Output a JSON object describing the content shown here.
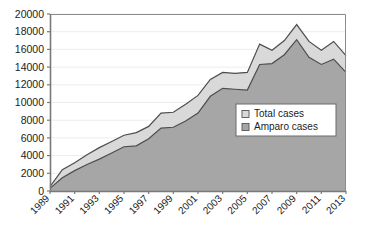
{
  "chart_data": {
    "type": "area",
    "title": "",
    "subtitle": "",
    "xlabel": "",
    "ylabel": "",
    "stacked": false,
    "grid": true,
    "grid_axis": "y",
    "legend_position": "inside-right",
    "xlim": [
      1989,
      2013
    ],
    "ylim": [
      0,
      20000
    ],
    "y_ticks": [
      0,
      2000,
      4000,
      6000,
      8000,
      10000,
      12000,
      14000,
      16000,
      18000,
      20000
    ],
    "y_tick_labels": [
      "0",
      "2000",
      "4000",
      "6000",
      "8000",
      "10000",
      "12000",
      "14000",
      "16000",
      "18000",
      "20000"
    ],
    "x_tick_labels": [
      "1989",
      "1991",
      "1993",
      "1995",
      "1997",
      "1999",
      "2001",
      "2003",
      "2005",
      "2007",
      "2009",
      "2011",
      "2013"
    ],
    "x_tick_values": [
      1989,
      1991,
      1993,
      1995,
      1997,
      1999,
      2001,
      2003,
      2005,
      2007,
      2009,
      2011,
      2013
    ],
    "x": [
      1989,
      1990,
      1991,
      1992,
      1993,
      1994,
      1995,
      1996,
      1997,
      1998,
      1999,
      2000,
      2001,
      2002,
      2003,
      2004,
      2005,
      2006,
      2007,
      2008,
      2009,
      2010,
      2011,
      2012,
      2013
    ],
    "series": [
      {
        "name": "Total cases",
        "color": "#d9d9d9",
        "line_color": "#4d4d4d",
        "values": [
          500,
          2400,
          3200,
          4100,
          4900,
          5600,
          6300,
          6600,
          7300,
          8800,
          8900,
          9800,
          10800,
          12600,
          13400,
          13300,
          13400,
          16600,
          15900,
          17000,
          18800,
          16900,
          15900,
          16900,
          15300
        ]
      },
      {
        "name": "Amparo cases",
        "color": "#a6a6a6",
        "line_color": "#4d4d4d",
        "values": [
          300,
          1500,
          2300,
          3000,
          3600,
          4300,
          5000,
          5100,
          5900,
          7100,
          7200,
          7900,
          8800,
          10700,
          11600,
          11500,
          11400,
          14300,
          14400,
          15400,
          17100,
          15100,
          14300,
          14900,
          13400
        ]
      }
    ],
    "legend": [
      {
        "label": "Total cases",
        "swatch": "#d9d9d9"
      },
      {
        "label": "Amparo cases",
        "swatch": "#a6a6a6"
      }
    ]
  },
  "axis": {
    "plot_left": 50,
    "plot_right": 346,
    "plot_top": 14,
    "plot_bottom": 191
  }
}
